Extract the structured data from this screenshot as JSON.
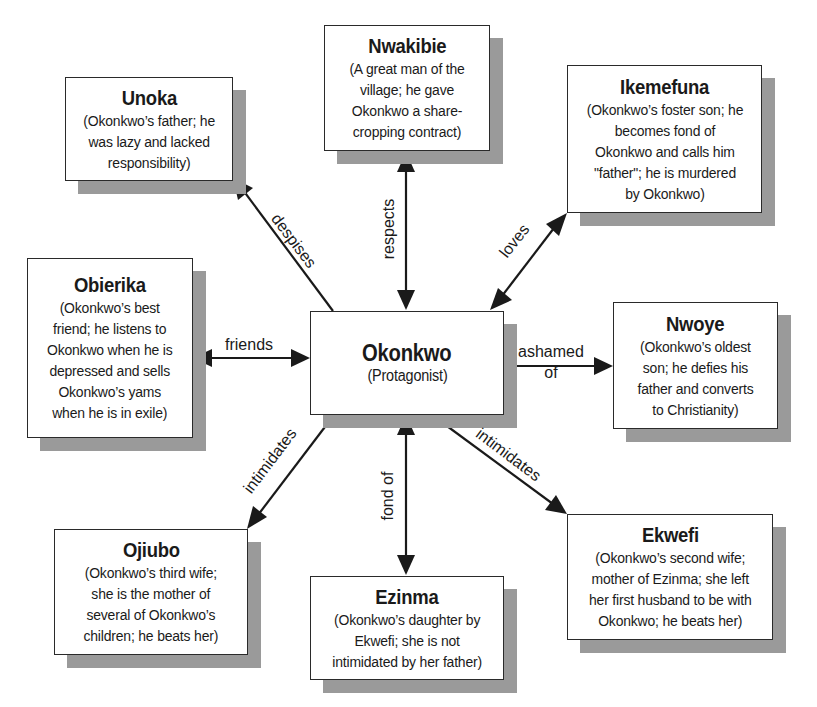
{
  "diagram": {
    "type": "character-relationship-map",
    "center": {
      "id": "okonkwo",
      "name": "Okonkwo",
      "desc_lines": [
        "(Protagonist)"
      ]
    },
    "nodes": {
      "unoka": {
        "name": "Unoka",
        "desc_lines": [
          "(Okonkwo’s father; he",
          "was lazy and lacked",
          "responsibility)"
        ]
      },
      "nwakibie": {
        "name": "Nwakibie",
        "desc_lines": [
          "(A great man of the",
          "village; he gave",
          "Okonkwo a share-",
          "cropping contract)"
        ]
      },
      "ikemefuna": {
        "name": "Ikemefuna",
        "desc_lines": [
          "(Okonkwo’s foster son; he",
          "becomes fond of",
          "Okonkwo and calls him",
          "\"father\"; he is murdered",
          "by Okonkwo)"
        ]
      },
      "obierika": {
        "name": "Obierika",
        "desc_lines": [
          "(Okonkwo’s best",
          "friend; he listens to",
          "Okonkwo when he is",
          "depressed and sells",
          "Okonkwo’s yams",
          "when he is in exile)"
        ]
      },
      "nwoye": {
        "name": "Nwoye",
        "desc_lines": [
          "(Okonkwo’s oldest",
          "son; he defies his",
          "father and converts",
          "to Christianity)"
        ]
      },
      "ojiubo": {
        "name": "Ojiubo",
        "desc_lines": [
          "(Okonkwo’s third wife;",
          "she is the mother of",
          "several of Okonkwo’s",
          "children; he beats her)"
        ]
      },
      "ezinma": {
        "name": "Ezinma",
        "desc_lines": [
          "(Okonkwo’s daughter by",
          "Ekwefi; she is not",
          "intimidated by her father)"
        ]
      },
      "ekwefi": {
        "name": "Ekwefi",
        "desc_lines": [
          "(Okonkwo’s second wife;",
          "mother of Ezinma; she left",
          "her first husband to be with",
          "Okonkwo; he beats her)"
        ]
      }
    },
    "edges": {
      "unoka": {
        "from": "okonkwo",
        "to": "unoka",
        "label": "despises",
        "direction": "one-way"
      },
      "nwakibie": {
        "from": "okonkwo",
        "to": "nwakibie",
        "label": "respects",
        "direction": "two-way"
      },
      "ikemefuna": {
        "from": "okonkwo",
        "to": "ikemefuna",
        "label": "loves",
        "direction": "two-way"
      },
      "obierika": {
        "from": "okonkwo",
        "to": "obierika",
        "label": "friends",
        "direction": "two-way"
      },
      "nwoye": {
        "from": "okonkwo",
        "to": "nwoye",
        "label_lines": [
          "ashamed",
          "of"
        ],
        "direction": "one-way"
      },
      "ojiubo": {
        "from": "okonkwo",
        "to": "ojiubo",
        "label": "intimidates",
        "direction": "one-way"
      },
      "ezinma": {
        "from": "okonkwo",
        "to": "ezinma",
        "label": "fond of",
        "direction": "two-way"
      },
      "ekwefi": {
        "from": "okonkwo",
        "to": "ekwefi",
        "label": "intimidates",
        "direction": "one-way"
      }
    },
    "colors": {
      "box_border": "#2a2a2a",
      "box_fill": "#ffffff",
      "shadow": "#9a9a9a",
      "arrow": "#1a1a1a",
      "background": "#ffffff"
    }
  }
}
